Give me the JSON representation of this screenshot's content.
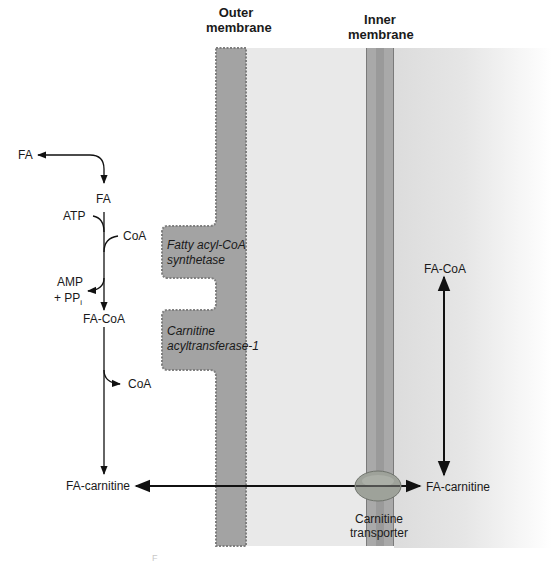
{
  "headers": {
    "outer_membrane": [
      "Outer",
      "membrane"
    ],
    "inner_membrane": [
      "Inner",
      "membrane"
    ]
  },
  "cytosol": {
    "fa_left": "FA",
    "fa": "FA",
    "atp": "ATP",
    "coa_in": "CoA",
    "amp": "AMP",
    "ppi_prefix": "+ PP",
    "ppi_sub": "i",
    "fa_coa": "FA-CoA",
    "coa_out": "CoA",
    "fa_carnitine": "FA-carnitine"
  },
  "enzymes": {
    "synthetase": [
      "Fatty acyl-CoA",
      "synthetase"
    ],
    "cat1": [
      "Carnitine",
      "acyltransferase-1"
    ]
  },
  "matrix": {
    "fa_coa": "FA-CoA",
    "fa_carnitine": "FA-carnitine"
  },
  "transporter": [
    "Carnitine",
    "transporter"
  ],
  "artifact": "F",
  "colors": {
    "membrane": "#a3a3a3",
    "membrane_edge": "#7e7e7e",
    "intermembrane": "#e9e9e9",
    "transporter": "#9ea29a",
    "arrow": "#111111"
  }
}
